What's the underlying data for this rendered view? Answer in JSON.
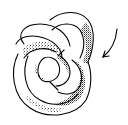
{
  "illustration": {
    "subject": "knotted tube (trefoil-like torus knot) line drawing with stippled shading",
    "line_color": "#000000",
    "background_color": "#ffffff",
    "annotation": {
      "type": "curved arrow",
      "direction": "pointing down-left toward the knot"
    }
  }
}
